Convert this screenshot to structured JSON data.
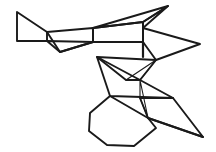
{
  "figure": {
    "canvas": {
      "width": 216,
      "height": 152,
      "background": "#ffffff"
    },
    "stroke": {
      "color": "#1a1a1a",
      "width_thick": 1.9,
      "width_thin": 1.1
    },
    "faces": [
      {
        "name": "left-trapezoid",
        "points": "17,12 47,32 47,41 17,41",
        "stroke_width": 1.9
      },
      {
        "name": "left-lower-wedge",
        "points": "47,32 93,28 93,42 60,52",
        "stroke_width": 1.9
      },
      {
        "name": "left-fold-triangle",
        "points": "47,41 60,52 93,42",
        "stroke_width": 1.9
      },
      {
        "name": "upper-right-quad",
        "points": "93,28 143,22 143,42 93,42",
        "stroke_width": 1.9
      },
      {
        "name": "top-spike-upper",
        "points": "93,28 168,6 143,22",
        "stroke_width": 1.9
      },
      {
        "name": "top-spike-lower",
        "points": "168,6 143,28 143,22",
        "stroke_width": 1.9
      },
      {
        "name": "right-arrow-wing",
        "points": "143,28 200,44 156,60 143,42",
        "stroke_width": 1.9
      },
      {
        "name": "mid-connector-stem",
        "points": "143,42 143,57",
        "stroke_width": 2.2
      },
      {
        "name": "mid-zigzag-upper",
        "points": "97,57 156,60 140,80 97,57",
        "stroke_width": 1.9
      },
      {
        "name": "mid-zigzag-band",
        "points": "126,80 140,80 156,60",
        "stroke_width": 1.1
      },
      {
        "name": "mid-zigzag-lower",
        "points": "97,57 126,80 140,80 173,98 110,96",
        "stroke_width": 1.9
      },
      {
        "name": "lower-band-thin",
        "points": "140,98 173,98",
        "stroke_width": 1.3
      },
      {
        "name": "lower-connector",
        "points": "140,80 140,98 148,118",
        "stroke_width": 1.1
      },
      {
        "name": "bottom-right-spike",
        "points": "173,98 203,137 148,118 140,98",
        "stroke_width": 1.9
      },
      {
        "name": "bottom-heptagon",
        "points": "110,96 90,113 89,131 107,145 134,146 156,128 148,118",
        "stroke_width": 1.9
      },
      {
        "name": "heptagon-tail",
        "points": "148,118 203,137",
        "stroke_width": 1.9
      }
    ]
  }
}
